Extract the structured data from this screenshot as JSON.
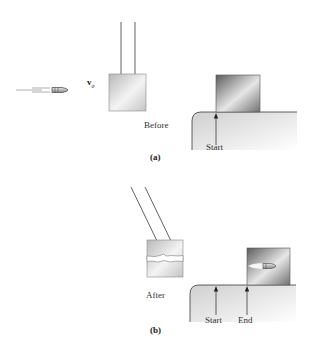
{
  "figure": {
    "panel_a": {
      "caption": "(a)",
      "velocity_label": "v",
      "velocity_subscript": "o",
      "block_label": "Before",
      "marker_start": "Start"
    },
    "panel_b": {
      "caption": "(b)",
      "block_label": "After",
      "marker_start": "Start",
      "marker_end": "End"
    }
  },
  "colors": {
    "line": "#3a3a3a",
    "block_light": "#f2f2f2",
    "block_mid": "#c8c8c8",
    "block_dark": "#6a6a6a",
    "table_fill": "#e6e6e6"
  }
}
